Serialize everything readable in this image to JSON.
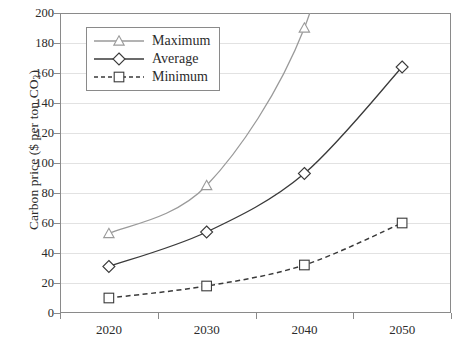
{
  "chart_data": {
    "type": "line",
    "title": "",
    "xlabel": "",
    "ylabel": "Carbon price ($ per ton CO2)",
    "ylabel_prefix": "Carbon price ($ per ton CO",
    "ylabel_sub": "2",
    "ylabel_suffix": ")",
    "categories": [
      "2020",
      "2030",
      "2040",
      "2050"
    ],
    "ylim": [
      0,
      200
    ],
    "ytick_step": 20,
    "yticks": [
      "0",
      "20",
      "40",
      "60",
      "80",
      "100",
      "120",
      "140",
      "160",
      "180",
      "200"
    ],
    "grid": true,
    "legend_position": "top-left-inside",
    "series": [
      {
        "name": "Maximum",
        "marker": "triangle",
        "linestyle": "solid",
        "color": "#9a9a9a",
        "values": [
          53,
          85,
          190,
          null
        ],
        "note": "2050 value rises above the 200 axis maximum and is clipped"
      },
      {
        "name": "Average",
        "marker": "diamond",
        "linestyle": "solid",
        "color": "#3a3a3a",
        "values": [
          31,
          54,
          93,
          164
        ]
      },
      {
        "name": "Minimum",
        "marker": "square",
        "linestyle": "dashed",
        "color": "#3a3a3a",
        "values": [
          10,
          18,
          32,
          60
        ]
      }
    ]
  },
  "legend": {
    "items": [
      {
        "label": "Maximum"
      },
      {
        "label": "Average"
      },
      {
        "label": "Minimum"
      }
    ]
  }
}
